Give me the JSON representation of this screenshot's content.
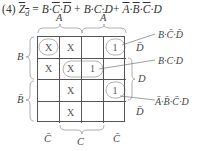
{
  "equation": {
    "prefix": "(4) ",
    "lhs": "Z",
    "lhs_sub": "d",
    "eq": " = ",
    "terms": [
      "B·C̄·D̄",
      "B·C·D",
      "Ā·B̄·C̄·D"
    ],
    "display": "(4) Z̄d = B·C̄·D̄ + B·C·D + Ā·B̄·C̄·D"
  },
  "kmap": {
    "top_labels": [
      "A",
      "Ā"
    ],
    "left_labels": [
      "B",
      "B̄"
    ],
    "right_labels": [
      "D̄",
      "D",
      "D̄"
    ],
    "bottom_labels": [
      "C̄",
      "C",
      "C̄"
    ],
    "cells": [
      [
        "X",
        "X",
        "",
        "1"
      ],
      [
        "X",
        "X",
        "1",
        ""
      ],
      [
        "",
        "X",
        "",
        "1"
      ],
      [
        "",
        "X",
        "",
        ""
      ]
    ],
    "groups": [
      {
        "term": "B·C̄·D̄",
        "cells": "r0c3 + r0c0 (wrap)"
      },
      {
        "term": "B·C·D",
        "cells": "r1c1-r1c2"
      },
      {
        "term": "Ā·B̄·C̄·D",
        "cells": "r2c3"
      }
    ]
  },
  "annotations": [
    {
      "text": "B·C̄·D̄",
      "target_row": 0
    },
    {
      "text": "B·C·D",
      "target_row": 1
    },
    {
      "text": "Ā·B̄·C̄·D",
      "target_row": 2
    }
  ]
}
